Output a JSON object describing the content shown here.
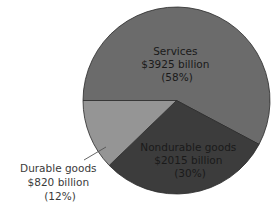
{
  "chart_data": {
    "type": "pie",
    "title": "",
    "categories": [
      "Services",
      "Nondurable goods",
      "Durable goods"
    ],
    "values": [
      3925,
      2015,
      820
    ],
    "unit": "billion dollars",
    "percentages": [
      58,
      30,
      12
    ],
    "slices": [
      {
        "name": "Services",
        "value": 3925,
        "value_label": "$3925 billion",
        "percent": 58,
        "percent_label": "(58%)",
        "color": "#6b6b6b",
        "start_deg": 180,
        "end_deg": 388
      },
      {
        "name": "Nondurable goods",
        "value": 2015,
        "value_label": "$2015 billion",
        "percent": 30,
        "percent_label": "(30%)",
        "color": "#3c3c3c",
        "start_deg": 28,
        "end_deg": 136
      },
      {
        "name": "Durable goods",
        "value": 820,
        "value_label": "$820 billion",
        "percent": 12,
        "percent_label": "(12%)",
        "color": "#959595",
        "start_deg": 136,
        "end_deg": 180
      }
    ],
    "legend": "none (direct labels)",
    "annotations": [
      "leader line from Durable goods label to its slice"
    ]
  }
}
